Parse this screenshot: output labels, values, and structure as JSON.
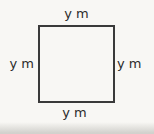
{
  "diagram": {
    "shape": "square",
    "labels": {
      "top": "y m",
      "right": "y m",
      "bottom": "y m",
      "left": "y m"
    },
    "colors": {
      "line": "#3a3a3a",
      "text": "#2b2b2b",
      "background": "#f8f7f4",
      "page_shadow": "#d2d1cd"
    }
  }
}
